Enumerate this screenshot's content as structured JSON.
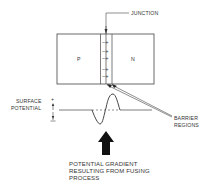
{
  "diagram": {
    "labels": {
      "junction": "JUNCTION",
      "p_region": "P",
      "n_region": "N",
      "surface_potential_line1": "SURFACE",
      "surface_potential_line2": "POTENTIAL",
      "plus_sign": "+",
      "minus_sign": "−",
      "barrier_line1": "BARRIER",
      "barrier_line2": "REGIONS",
      "caption_line1": "POTENTIAL GRADIENT",
      "caption_line2": "RESULTING FROM FUSING",
      "caption_line3": "PROCESS"
    },
    "junction_charges": [
      "−+",
      "−+",
      "−+",
      "−+",
      "−+"
    ],
    "colors": {
      "stroke": "#444444",
      "text": "#333333",
      "arrow": "#111111"
    }
  }
}
